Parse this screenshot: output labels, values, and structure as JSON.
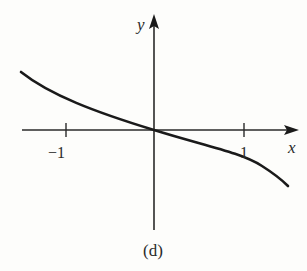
{
  "figure": {
    "caption": "(d)",
    "axes": {
      "x_label": "x",
      "y_label": "y",
      "x_ticks": [
        {
          "value": -1,
          "label": "−1"
        },
        {
          "value": 1,
          "label": "1"
        }
      ]
    },
    "curve": {
      "description": "decreasing curve through origin, concave up for x<0 and concave down for x>0",
      "color": "#1a1a1a"
    }
  }
}
